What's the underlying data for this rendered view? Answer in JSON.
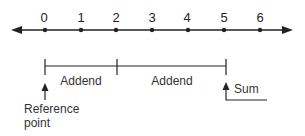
{
  "number_line": {
    "ticks": [
      "0",
      "1",
      "2",
      "3",
      "4",
      "5",
      "6"
    ]
  },
  "labels": {
    "addend_1": "Addend",
    "addend_2": "Addend",
    "sum": "Sum",
    "reference_line1": "Reference",
    "reference_line2": "point"
  },
  "colors": {
    "ink": "#222222",
    "background": "#ffffff"
  }
}
